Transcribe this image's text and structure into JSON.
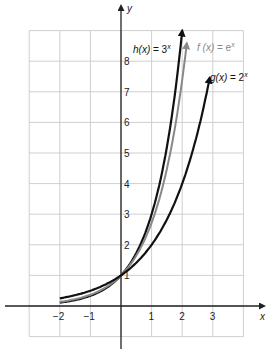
{
  "chart_data": {
    "type": "line",
    "title": "",
    "xlabel": "x",
    "ylabel": "y",
    "xlim": [
      -3,
      4
    ],
    "ylim": [
      -1,
      9
    ],
    "grid": true,
    "x_ticks": [
      "−2",
      "−1",
      "1",
      "2",
      "3"
    ],
    "y_ticks": [
      "1",
      "2",
      "3",
      "4",
      "5",
      "6",
      "7",
      "8"
    ],
    "series": [
      {
        "name": "h(x) = 3^x",
        "label_main": "h(x) = 3",
        "label_exp": "x",
        "color": "#111111",
        "x": [
          -2,
          -1,
          0,
          1,
          2
        ],
        "values": [
          0.11,
          0.33,
          1,
          3,
          9
        ],
        "x_end": 2.0
      },
      {
        "name": "f(x) = e^x",
        "label_main": "f (x) = e",
        "label_exp": "x",
        "color": "#888888",
        "x": [
          -2,
          -1,
          0,
          1,
          2
        ],
        "values": [
          0.14,
          0.37,
          1,
          2.72,
          7.39
        ],
        "x_end": 2.15
      },
      {
        "name": "g(x) = 2^x",
        "label_main": "g(x) = 2",
        "label_exp": "x",
        "color": "#111111",
        "x": [
          -2,
          -1,
          0,
          1,
          2,
          3
        ],
        "values": [
          0.25,
          0.5,
          1,
          2,
          4,
          8
        ],
        "x_end": 2.9
      }
    ]
  }
}
